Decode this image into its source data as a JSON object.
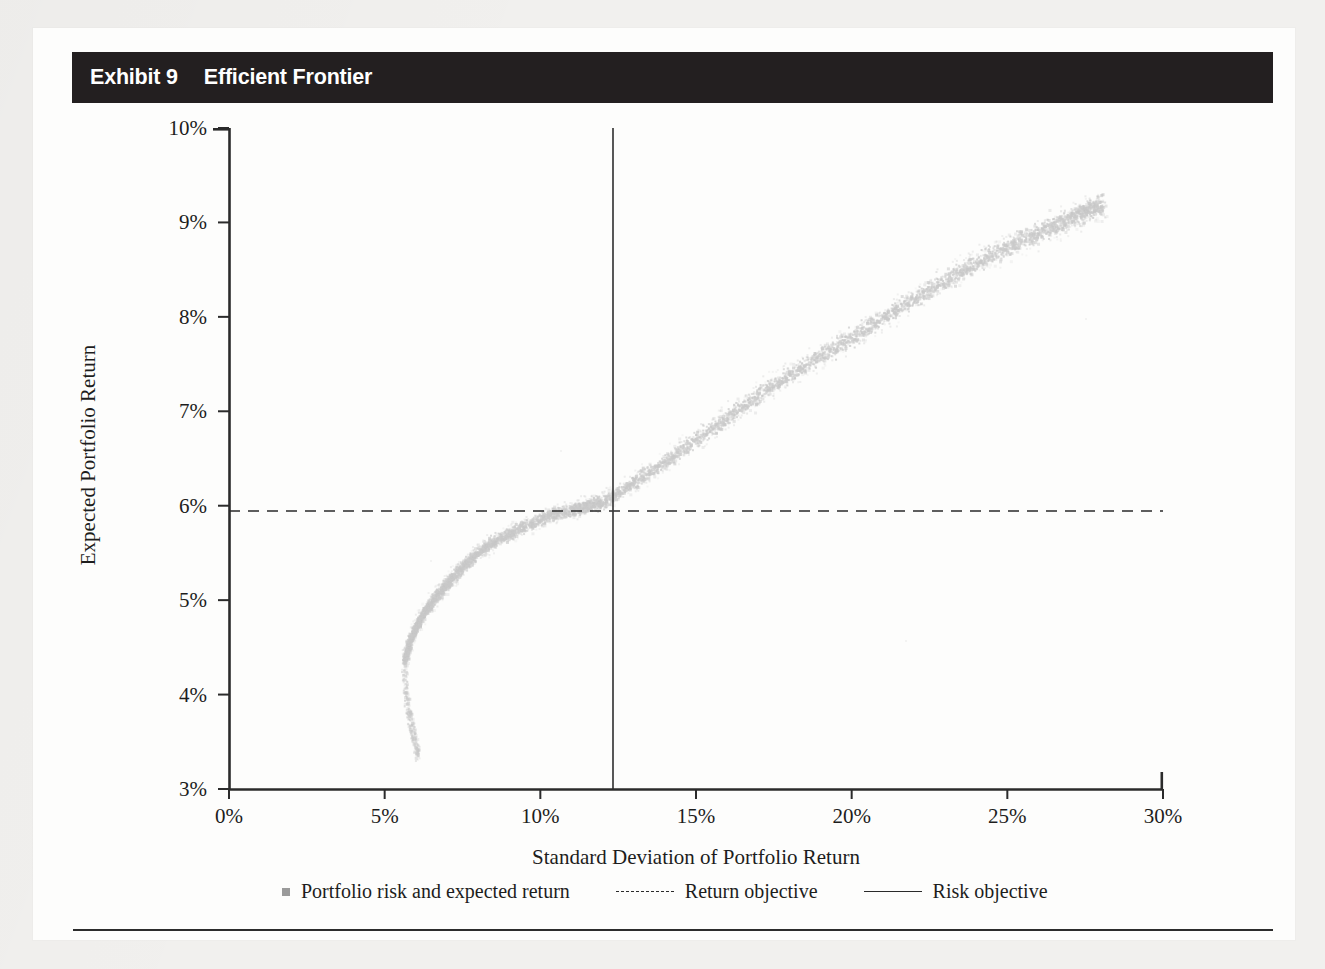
{
  "exhibit": {
    "number_label": "Exhibit 9",
    "title": "Efficient Frontier"
  },
  "chart_data": {
    "type": "scatter",
    "title": "Efficient Frontier",
    "xlabel": "Standard Deviation of Portfolio Return",
    "ylabel": "Expected Portfolio Return",
    "xlim": [
      0,
      30
    ],
    "ylim": [
      3,
      10
    ],
    "x_tick_labels": [
      "0%",
      "5%",
      "10%",
      "15%",
      "20%",
      "25%",
      "30%"
    ],
    "x_tick_values": [
      0,
      5,
      10,
      15,
      20,
      25,
      30
    ],
    "y_tick_labels": [
      "3%",
      "4%",
      "5%",
      "6%",
      "7%",
      "8%",
      "9%",
      "10%"
    ],
    "y_tick_values": [
      3,
      4,
      5,
      6,
      7,
      8,
      9,
      10
    ],
    "grid": false,
    "legend_position": "below-axis",
    "marker_color": "#c9c9c9",
    "line_color": "#2a2a2a",
    "series": [
      {
        "name": "Portfolio risk and expected return",
        "type": "scatter",
        "marker": "square",
        "color": "#c9c9c9",
        "description": "Dense cloud of feasible portfolios tracing the efficient frontier, rising from the minimum-variance point and curving upward to the right.",
        "frontier_points": [
          {
            "x": 5.6,
            "y": 4.35
          },
          {
            "x": 5.8,
            "y": 4.6
          },
          {
            "x": 6.1,
            "y": 4.8
          },
          {
            "x": 6.5,
            "y": 5.0
          },
          {
            "x": 7.0,
            "y": 5.2
          },
          {
            "x": 7.6,
            "y": 5.4
          },
          {
            "x": 8.3,
            "y": 5.6
          },
          {
            "x": 9.2,
            "y": 5.75
          },
          {
            "x": 10.2,
            "y": 5.9
          },
          {
            "x": 11.2,
            "y": 5.98
          },
          {
            "x": 12.0,
            "y": 6.05
          },
          {
            "x": 13.2,
            "y": 6.3
          },
          {
            "x": 14.5,
            "y": 6.6
          },
          {
            "x": 16.0,
            "y": 6.95
          },
          {
            "x": 17.5,
            "y": 7.3
          },
          {
            "x": 19.0,
            "y": 7.6
          },
          {
            "x": 20.5,
            "y": 7.9
          },
          {
            "x": 22.0,
            "y": 8.2
          },
          {
            "x": 23.5,
            "y": 8.5
          },
          {
            "x": 25.0,
            "y": 8.75
          },
          {
            "x": 26.3,
            "y": 8.95
          },
          {
            "x": 27.3,
            "y": 9.1
          },
          {
            "x": 28.0,
            "y": 9.2
          }
        ],
        "lower_branch_points": [
          {
            "x": 5.6,
            "y": 4.3
          },
          {
            "x": 5.65,
            "y": 4.0
          },
          {
            "x": 5.75,
            "y": 3.8
          },
          {
            "x": 5.85,
            "y": 3.65
          },
          {
            "x": 5.95,
            "y": 3.5
          },
          {
            "x": 6.05,
            "y": 3.35
          }
        ]
      },
      {
        "name": "Return objective",
        "type": "hline",
        "style": "dashed",
        "color": "#2a2a2a",
        "y": 6
      },
      {
        "name": "Risk objective",
        "type": "vline",
        "style": "solid",
        "color": "#2a2a2a",
        "x": 12
      }
    ],
    "annotations": [
      {
        "text": "Intersection of return objective and risk objective lies on the frontier at approximately (12%, 6%)."
      }
    ]
  },
  "legend": {
    "items": [
      {
        "label": "Portfolio risk and expected return",
        "swatch": "square-marker"
      },
      {
        "label": "Return objective",
        "swatch": "dashed-line"
      },
      {
        "label": "Risk objective",
        "swatch": "solid-line"
      }
    ]
  }
}
